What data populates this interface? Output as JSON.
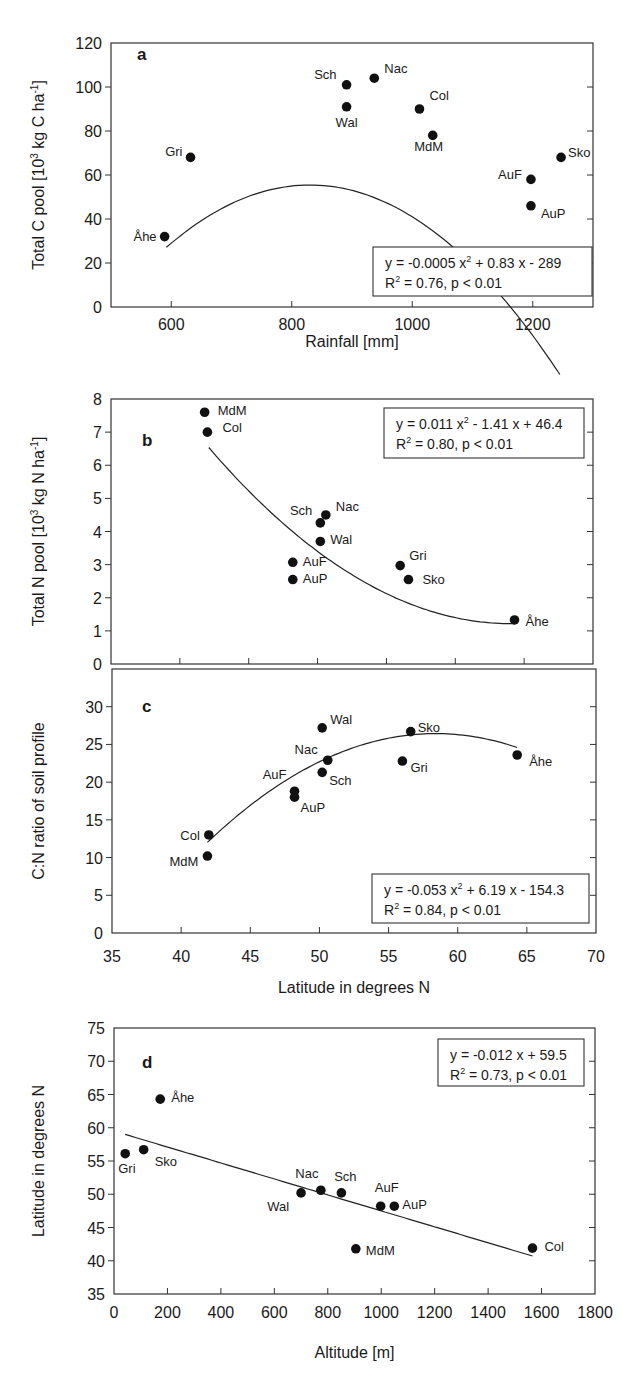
{
  "figure": {
    "panels": [
      {
        "id": "a",
        "letter": "a",
        "ylabel_main": "Total C pool [10",
        "ylabel_sup": "3",
        "ylabel_rest": " kg C ha",
        "ylabel_sup2": "-1",
        "ylabel_end": "]",
        "xlabel": "Rainfall [mm]",
        "equation_line1": "y = -0.0005 x",
        "equation_line1_sup": "2",
        "equation_line1_rest": " + 0.83 x - 289",
        "equation_line2_pre": "R",
        "equation_line2_sup": "2",
        "equation_line2_rest": " = 0.76, p < 0.01"
      },
      {
        "id": "b",
        "letter": "b",
        "ylabel_main": "Total N pool [10",
        "ylabel_sup": "3",
        "ylabel_rest": " kg N ha",
        "ylabel_sup2": "-1",
        "ylabel_end": "]",
        "xlabel": "",
        "equation_line1": "y = 0.011 x",
        "equation_line1_sup": "2",
        "equation_line1_rest": " - 1.41 x + 46.4",
        "equation_line2_pre": "R",
        "equation_line2_sup": "2",
        "equation_line2_rest": " = 0.80, p < 0.01"
      },
      {
        "id": "c",
        "letter": "c",
        "ylabel_main": "C:N ratio of soil profile",
        "ylabel_sup": "",
        "ylabel_rest": "",
        "ylabel_sup2": "",
        "ylabel_end": "",
        "xlabel": "Latitude in degrees N",
        "equation_line1": "y = -0.053 x",
        "equation_line1_sup": "2",
        "equation_line1_rest": " + 6.19 x - 154.3",
        "equation_line2_pre": "R",
        "equation_line2_sup": "2",
        "equation_line2_rest": " = 0.84, p < 0.01"
      },
      {
        "id": "d",
        "letter": "d",
        "ylabel_main": "Latitude in degrees N",
        "ylabel_sup": "",
        "ylabel_rest": "",
        "ylabel_sup2": "",
        "ylabel_end": "",
        "xlabel": "Altitude [m]",
        "equation_line1": "y = -0.012 x + 59.5",
        "equation_line1_sup": "",
        "equation_line1_rest": "",
        "equation_line2_pre": "R",
        "equation_line2_sup": "2",
        "equation_line2_rest": " = 0.73, p < 0.01"
      }
    ]
  },
  "chart_data": [
    {
      "type": "scatter",
      "panel": "a",
      "title": "",
      "xlabel": "Rainfall [mm]",
      "ylabel": "Total C pool [10^3 kg C ha^-1]",
      "xlim": [
        500,
        1300
      ],
      "ylim": [
        0,
        120
      ],
      "xticks": [
        600,
        800,
        1000,
        1200
      ],
      "yticks": [
        0,
        20,
        40,
        60,
        80,
        100,
        120
      ],
      "grid": false,
      "points": [
        {
          "label": "Åhe",
          "x": 589,
          "y": 32
        },
        {
          "label": "Gri",
          "x": 632,
          "y": 68
        },
        {
          "label": "Sch",
          "x": 891,
          "y": 101
        },
        {
          "label": "Wal",
          "x": 891,
          "y": 91
        },
        {
          "label": "Nac",
          "x": 937,
          "y": 104
        },
        {
          "label": "Col",
          "x": 1012,
          "y": 90
        },
        {
          "label": "MdM",
          "x": 1034,
          "y": 78
        },
        {
          "label": "AuF",
          "x": 1197,
          "y": 58
        },
        {
          "label": "AuP",
          "x": 1197,
          "y": 46
        },
        {
          "label": "Sko",
          "x": 1247,
          "y": 68
        }
      ],
      "fit": {
        "kind": "quadratic",
        "coefficients": [
          -0.0005,
          0.83,
          -289
        ],
        "x_range": [
          592,
          1245
        ],
        "equation": "y = -0.0005 x^2 + 0.83 x - 289",
        "r2": 0.76,
        "p": "p < 0.01"
      }
    },
    {
      "type": "scatter",
      "panel": "b",
      "title": "",
      "xlabel": "Latitude in degrees N",
      "ylabel": "Total N pool [10^3 kg N ha^-1]",
      "xlim": [
        35,
        70
      ],
      "ylim": [
        0,
        8
      ],
      "xticks": [
        40,
        45,
        50,
        55,
        60,
        65
      ],
      "yticks": [
        0,
        1,
        2,
        3,
        4,
        5,
        6,
        7,
        8
      ],
      "grid": false,
      "points": [
        {
          "label": "MdM",
          "x": 41.8,
          "y": 7.6
        },
        {
          "label": "Col",
          "x": 42.0,
          "y": 7.0
        },
        {
          "label": "Sch",
          "x": 50.2,
          "y": 4.26
        },
        {
          "label": "Nac",
          "x": 50.6,
          "y": 4.5
        },
        {
          "label": "Wal",
          "x": 50.2,
          "y": 3.7
        },
        {
          "label": "AuF",
          "x": 48.2,
          "y": 3.07
        },
        {
          "label": "AuP",
          "x": 48.2,
          "y": 2.55
        },
        {
          "label": "Gri",
          "x": 56.0,
          "y": 2.97
        },
        {
          "label": "Sko",
          "x": 56.6,
          "y": 2.55
        },
        {
          "label": "Åhe",
          "x": 64.3,
          "y": 1.33
        }
      ],
      "fit": {
        "kind": "quadratic",
        "coefficients": [
          0.011,
          -1.41,
          46.4
        ],
        "x_range": [
          42.1,
          64.3
        ],
        "equation": "y = 0.011 x^2 - 1.41 x + 46.4",
        "r2": 0.8,
        "p": "p < 0.01"
      }
    },
    {
      "type": "scatter",
      "panel": "c",
      "title": "",
      "xlabel": "Latitude in degrees N",
      "ylabel": "C:N ratio of soil profile",
      "xlim": [
        35,
        70
      ],
      "ylim": [
        0,
        35
      ],
      "xticks": [
        35,
        40,
        45,
        50,
        55,
        60,
        65,
        70
      ],
      "yticks": [
        0,
        5,
        10,
        15,
        20,
        25,
        30
      ],
      "grid": false,
      "points": [
        {
          "label": "Col",
          "x": 42.0,
          "y": 13.0
        },
        {
          "label": "MdM",
          "x": 41.9,
          "y": 10.2
        },
        {
          "label": "AuF",
          "x": 48.2,
          "y": 18.8
        },
        {
          "label": "AuP",
          "x": 48.2,
          "y": 18.0
        },
        {
          "label": "Wal",
          "x": 50.2,
          "y": 27.2
        },
        {
          "label": "Nac",
          "x": 50.6,
          "y": 22.9
        },
        {
          "label": "Sch",
          "x": 50.2,
          "y": 21.3
        },
        {
          "label": "Sko",
          "x": 56.6,
          "y": 26.7
        },
        {
          "label": "Gri",
          "x": 56.0,
          "y": 22.8
        },
        {
          "label": "Åhe",
          "x": 64.3,
          "y": 23.6
        }
      ],
      "fit": {
        "kind": "quadratic",
        "coefficients": [
          -0.053,
          6.19,
          -154.3
        ],
        "x_range": [
          41.9,
          64.3
        ],
        "equation": "y = -0.053 x^2 + 6.19 x - 154.3",
        "r2": 0.84,
        "p": "p < 0.01"
      }
    },
    {
      "type": "scatter",
      "panel": "d",
      "title": "",
      "xlabel": "Altitude [m]",
      "ylabel": "Latitude in degrees N",
      "xlim": [
        0,
        1800
      ],
      "ylim": [
        35,
        75
      ],
      "xticks": [
        0,
        200,
        400,
        600,
        800,
        1000,
        1200,
        1400,
        1600,
        1800
      ],
      "yticks": [
        35,
        40,
        45,
        50,
        55,
        60,
        65,
        70,
        75
      ],
      "grid": false,
      "points": [
        {
          "label": "Gri",
          "x": 42,
          "y": 56.1
        },
        {
          "label": "Sko",
          "x": 111,
          "y": 56.7
        },
        {
          "label": "Åhe",
          "x": 173,
          "y": 64.3
        },
        {
          "label": "Wal",
          "x": 700,
          "y": 50.2
        },
        {
          "label": "Nac",
          "x": 774,
          "y": 50.6
        },
        {
          "label": "Sch",
          "x": 851,
          "y": 50.2
        },
        {
          "label": "AuF",
          "x": 998,
          "y": 48.2
        },
        {
          "label": "AuP",
          "x": 1049,
          "y": 48.2
        },
        {
          "label": "MdM",
          "x": 905,
          "y": 41.8
        },
        {
          "label": "Col",
          "x": 1566,
          "y": 41.9
        }
      ],
      "fit": {
        "kind": "linear",
        "coefficients": [
          -0.012,
          59.5
        ],
        "x_range": [
          42,
          1566
        ],
        "equation": "y = -0.012 x + 59.5",
        "r2": 0.73,
        "p": "p < 0.01"
      }
    }
  ]
}
